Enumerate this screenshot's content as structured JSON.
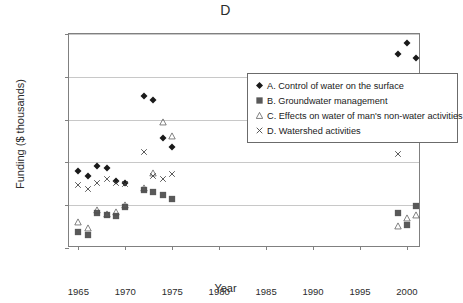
{
  "chart_data": {
    "type": "scatter",
    "title": "D",
    "xlabel": "Year",
    "ylabel": "Funding ($ thousands)",
    "xlim": [
      1964,
      2001.5
    ],
    "ylim": [
      0,
      25000
    ],
    "xticks": [
      1965,
      1970,
      1975,
      1980,
      1985,
      1990,
      1995,
      2000
    ],
    "xtick_labels": [
      "1965",
      "1970",
      "1975",
      "1980",
      "1985",
      "1990",
      "1995",
      "2000"
    ],
    "yticks": [
      0,
      5000,
      10000,
      15000,
      20000,
      25000
    ],
    "ytick_labels": [
      "0",
      "5,000",
      "10,000",
      "15,000",
      "20,000",
      "25,000"
    ],
    "grid": "horizontal",
    "legend_position": "upper-center",
    "series": [
      {
        "name": "A. Control of water on the surface",
        "marker": "diamond",
        "color": "#1a1a1a",
        "points": [
          {
            "x": 1965,
            "y": 9050
          },
          {
            "x": 1966,
            "y": 8450
          },
          {
            "x": 1967,
            "y": 9550
          },
          {
            "x": 1968,
            "y": 9300
          },
          {
            "x": 1969,
            "y": 7800
          },
          {
            "x": 1970,
            "y": 7600
          },
          {
            "x": 1972,
            "y": 17700
          },
          {
            "x": 1973,
            "y": 17250
          },
          {
            "x": 1974,
            "y": 12900
          },
          {
            "x": 1975,
            "y": 11800
          },
          {
            "x": 1999,
            "y": 22650
          },
          {
            "x": 2000,
            "y": 24000
          },
          {
            "x": 2001,
            "y": 22200
          }
        ]
      },
      {
        "name": "B. Groundwater management",
        "marker": "square",
        "color": "#595959",
        "points": [
          {
            "x": 1965,
            "y": 1850
          },
          {
            "x": 1966,
            "y": 1500
          },
          {
            "x": 1967,
            "y": 4100
          },
          {
            "x": 1968,
            "y": 3850
          },
          {
            "x": 1969,
            "y": 3700
          },
          {
            "x": 1970,
            "y": 4800
          },
          {
            "x": 1972,
            "y": 6800
          },
          {
            "x": 1973,
            "y": 6500
          },
          {
            "x": 1974,
            "y": 6150
          },
          {
            "x": 1975,
            "y": 5750
          },
          {
            "x": 1999,
            "y": 4100
          },
          {
            "x": 2000,
            "y": 2700
          },
          {
            "x": 2001,
            "y": 4850
          }
        ]
      },
      {
        "name": "C. Effects on water of man's non-water activities",
        "marker": "triangle",
        "color": "#4d4d4d",
        "points": [
          {
            "x": 1965,
            "y": 3050
          },
          {
            "x": 1966,
            "y": 2350
          },
          {
            "x": 1967,
            "y": 4400
          },
          {
            "x": 1968,
            "y": 3950
          },
          {
            "x": 1969,
            "y": 4150
          },
          {
            "x": 1970,
            "y": 5000
          },
          {
            "x": 1972,
            "y": 7000
          },
          {
            "x": 1973,
            "y": 8800
          },
          {
            "x": 1974,
            "y": 14700
          },
          {
            "x": 1975,
            "y": 13050
          },
          {
            "x": 1999,
            "y": 2550
          },
          {
            "x": 2000,
            "y": 3500
          },
          {
            "x": 2001,
            "y": 3850
          }
        ]
      },
      {
        "name": "D. Watershed activities",
        "marker": "cross",
        "color": "#3d3d3d",
        "points": [
          {
            "x": 1965,
            "y": 7400
          },
          {
            "x": 1966,
            "y": 6950
          },
          {
            "x": 1967,
            "y": 7650
          },
          {
            "x": 1968,
            "y": 8050
          },
          {
            "x": 1969,
            "y": 7550
          },
          {
            "x": 1970,
            "y": 7450
          },
          {
            "x": 1972,
            "y": 11200
          },
          {
            "x": 1973,
            "y": 8450
          },
          {
            "x": 1974,
            "y": 8050
          },
          {
            "x": 1975,
            "y": 8650
          },
          {
            "x": 1999,
            "y": 10950
          },
          {
            "x": 2000,
            "y": 12950
          },
          {
            "x": 2001,
            "y": 12950
          }
        ]
      }
    ]
  }
}
